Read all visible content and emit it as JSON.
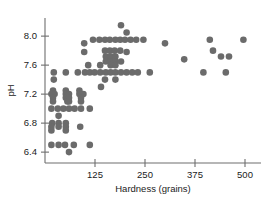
{
  "chart_data": {
    "type": "scatter",
    "title": "",
    "subtitle": "",
    "xlabel": "Hardness (grains)",
    "ylabel": "pH",
    "xlim": [
      0,
      540
    ],
    "ylim": [
      6.25,
      8.25
    ],
    "xticks": [
      125,
      250,
      375,
      500
    ],
    "xticklabels": [
      "125",
      "250",
      "375",
      "500"
    ],
    "yticks": [
      6.4,
      6.8,
      7.2,
      7.6,
      8.0
    ],
    "yticklabels": [
      "6.4",
      "6.8",
      "7.2",
      "7.6",
      "8.0"
    ],
    "grid": false,
    "legend": null,
    "marker": "circle",
    "marker_color": "#6b6b6b",
    "marker_size": 3.3,
    "axis_color": "#6e6e6e",
    "points": [
      [
        22,
        7.5
      ],
      [
        52,
        7.5
      ],
      [
        82,
        7.5
      ],
      [
        100,
        7.5
      ],
      [
        112,
        7.5
      ],
      [
        22,
        7.4
      ],
      [
        20,
        7.25
      ],
      [
        52,
        7.25
      ],
      [
        86,
        7.25
      ],
      [
        16,
        7.2
      ],
      [
        24,
        7.2
      ],
      [
        52,
        7.2
      ],
      [
        60,
        7.2
      ],
      [
        86,
        7.2
      ],
      [
        96,
        7.2
      ],
      [
        20,
        7.15
      ],
      [
        52,
        7.15
      ],
      [
        60,
        7.15
      ],
      [
        90,
        7.15
      ],
      [
        20,
        7.1
      ],
      [
        56,
        7.1
      ],
      [
        60,
        7.1
      ],
      [
        90,
        7.1
      ],
      [
        16,
        7.0
      ],
      [
        32,
        7.0
      ],
      [
        46,
        7.0
      ],
      [
        60,
        7.0
      ],
      [
        74,
        7.0
      ],
      [
        90,
        7.0
      ],
      [
        112,
        7.0
      ],
      [
        34,
        6.9
      ],
      [
        18,
        6.8
      ],
      [
        34,
        6.8
      ],
      [
        52,
        6.8
      ],
      [
        88,
        6.75
      ],
      [
        16,
        6.75
      ],
      [
        34,
        6.75
      ],
      [
        52,
        6.75
      ],
      [
        16,
        6.7
      ],
      [
        52,
        6.7
      ],
      [
        16,
        6.5
      ],
      [
        34,
        6.5
      ],
      [
        50,
        6.5
      ],
      [
        72,
        6.5
      ],
      [
        112,
        6.5
      ],
      [
        60,
        6.4
      ],
      [
        108,
        7.6
      ],
      [
        120,
        7.95
      ],
      [
        136,
        7.95
      ],
      [
        150,
        7.95
      ],
      [
        162,
        7.95
      ],
      [
        176,
        7.95
      ],
      [
        188,
        7.95
      ],
      [
        200,
        7.95
      ],
      [
        214,
        7.95
      ],
      [
        228,
        7.95
      ],
      [
        246,
        7.95
      ],
      [
        190,
        8.15
      ],
      [
        204,
        8.05
      ],
      [
        98,
        7.9
      ],
      [
        98,
        7.78
      ],
      [
        150,
        7.8
      ],
      [
        162,
        7.8
      ],
      [
        174,
        7.8
      ],
      [
        188,
        7.8
      ],
      [
        204,
        7.78
      ],
      [
        152,
        7.72
      ],
      [
        164,
        7.72
      ],
      [
        176,
        7.72
      ],
      [
        152,
        7.65
      ],
      [
        164,
        7.65
      ],
      [
        176,
        7.65
      ],
      [
        190,
        7.65
      ],
      [
        138,
        7.6
      ],
      [
        164,
        7.6
      ],
      [
        176,
        7.6
      ],
      [
        124,
        7.5
      ],
      [
        138,
        7.5
      ],
      [
        152,
        7.5
      ],
      [
        164,
        7.5
      ],
      [
        176,
        7.5
      ],
      [
        190,
        7.5
      ],
      [
        204,
        7.5
      ],
      [
        218,
        7.5
      ],
      [
        232,
        7.5
      ],
      [
        262,
        7.5
      ],
      [
        150,
        7.4
      ],
      [
        176,
        7.4
      ],
      [
        140,
        7.3
      ],
      [
        300,
        7.9
      ],
      [
        348,
        7.68
      ],
      [
        412,
        7.95
      ],
      [
        420,
        7.8
      ],
      [
        440,
        7.72
      ],
      [
        460,
        7.72
      ],
      [
        396,
        7.5
      ],
      [
        452,
        7.5
      ],
      [
        496,
        7.95
      ]
    ]
  }
}
